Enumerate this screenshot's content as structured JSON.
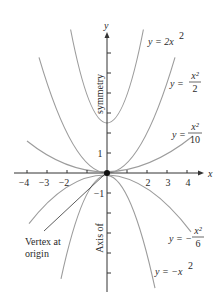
{
  "diagram": {
    "axes": {
      "x_label": "x",
      "y_label": "y",
      "x_ticks": [
        {
          "value": -4,
          "label": "−4"
        },
        {
          "value": -3,
          "label": "−3"
        },
        {
          "value": -2,
          "label": "−2"
        },
        {
          "value": -1,
          "label": ""
        },
        {
          "value": 1,
          "label": ""
        },
        {
          "value": 2,
          "label": "2"
        },
        {
          "value": 3,
          "label": "3"
        },
        {
          "value": 4,
          "label": "4"
        }
      ],
      "y_ticks": [
        {
          "value": 6,
          "label": ""
        },
        {
          "value": 5,
          "label": ""
        },
        {
          "value": 4,
          "label": ""
        },
        {
          "value": 3,
          "label": ""
        },
        {
          "value": 2,
          "label": ""
        },
        {
          "value": 1,
          "label": "1"
        },
        {
          "value": -1,
          "label": "−1"
        },
        {
          "value": -2,
          "label": ""
        },
        {
          "value": -3,
          "label": ""
        },
        {
          "value": -4,
          "label": ""
        },
        {
          "value": -5,
          "label": ""
        }
      ],
      "axis_of_symmetry_label_top": "symmetry",
      "axis_of_symmetry_label_bottom": "Axis of"
    },
    "curves": [
      {
        "id": "y-2x2",
        "label_prefix": "y = 2x",
        "label_sup": "2",
        "coefficient": 2
      },
      {
        "id": "y-x2-over-2",
        "label_prefix": "y = ",
        "label_num": "x²",
        "label_den": "2",
        "coefficient": 0.5
      },
      {
        "id": "y-x2-over-10",
        "label_prefix": "y = ",
        "label_num": "x²",
        "label_den": "10",
        "coefficient": 0.1
      },
      {
        "id": "y-neg-x2-over-6",
        "label_prefix": "y = −",
        "label_num": "x²",
        "label_den": "6",
        "coefficient": -0.16667
      },
      {
        "id": "y-neg-x2",
        "label_prefix": "y = −x",
        "label_sup": "2",
        "coefficient": -1
      }
    ],
    "annotation": {
      "line1": "Vertex at",
      "line2": "origin"
    },
    "colors": {
      "axis": "#333333",
      "curve": "#9a9a9a",
      "vertex": "#111111",
      "text": "#2a2a2a"
    }
  }
}
